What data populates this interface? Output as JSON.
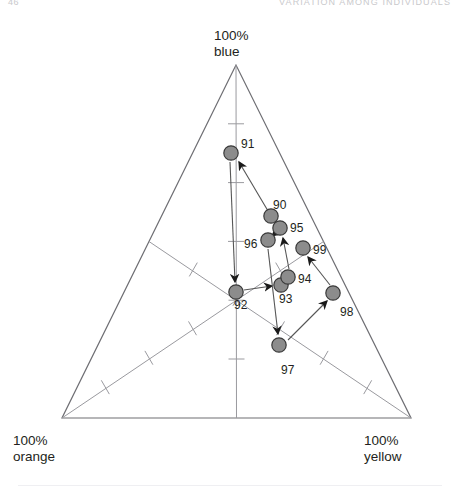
{
  "running_head": {
    "page_number": "46",
    "title": "VARIATION AMONG INDIVIDUALS"
  },
  "corner_labels": {
    "top": "100%\nblue",
    "top_line1": "100%",
    "top_line2": "blue",
    "bottom_left_line1": "100%",
    "bottom_left_line2": "orange",
    "bottom_right_line1": "100%",
    "bottom_right_line2": "yellow"
  },
  "colors": {
    "marker_fill": "#8c8c8c",
    "marker_stroke": "#3a3a3a",
    "triangle_stroke": "#6e6e73",
    "axis_stroke": "#9a9a9f",
    "path_stroke": "#555555",
    "arrow_fill": "#1a1a1a",
    "text": "#231f20",
    "running_head": "#c9c9cc",
    "background": "#ffffff"
  },
  "chart_data": {
    "type": "scatter",
    "title": "",
    "subtitle": "",
    "xlabel": "",
    "ylabel": "",
    "projection": "ternary",
    "axes": [
      {
        "name": "blue",
        "vertex_label": "100% blue",
        "vertex": [
          236,
          65
        ]
      },
      {
        "name": "orange",
        "vertex_label": "100% orange",
        "vertex": [
          62,
          418
        ]
      },
      {
        "name": "yellow",
        "vertex_label": "100% yellow",
        "vertex": [
          411,
          418
        ]
      }
    ],
    "grid": false,
    "legend": "none",
    "tick_count_per_axis": 5,
    "series": [
      {
        "name": "trajectory",
        "connected": true,
        "arrows": true,
        "points": [
          {
            "label": "90",
            "x": 271,
            "y": 216,
            "label_dx": 2,
            "label_dy": -18
          },
          {
            "label": "91",
            "x": 231,
            "y": 153,
            "label_dx": 10,
            "label_dy": -16
          },
          {
            "label": "92",
            "x": 236,
            "y": 292,
            "label_dx": -2,
            "label_dy": 6
          },
          {
            "label": "93",
            "x": 281,
            "y": 285,
            "label_dx": -2,
            "label_dy": 7
          },
          {
            "label": "94",
            "x": 288,
            "y": 277,
            "label_dx": 10,
            "label_dy": -5
          },
          {
            "label": "95",
            "x": 280,
            "y": 228,
            "label_dx": 10,
            "label_dy": -7
          },
          {
            "label": "96",
            "x": 268,
            "y": 240,
            "label_dx": -24,
            "label_dy": -3
          },
          {
            "label": "97",
            "x": 279,
            "y": 345,
            "label_dx": 2,
            "label_dy": 18
          },
          {
            "label": "98",
            "x": 333,
            "y": 293,
            "label_dx": 7,
            "label_dy": 12
          },
          {
            "label": "99",
            "x": 303,
            "y": 248,
            "label_dx": 10,
            "label_dy": -5
          }
        ],
        "sequence": [
          "90",
          "91",
          "92",
          "93",
          "94",
          "95",
          "96",
          "97",
          "98",
          "99"
        ]
      }
    ]
  }
}
